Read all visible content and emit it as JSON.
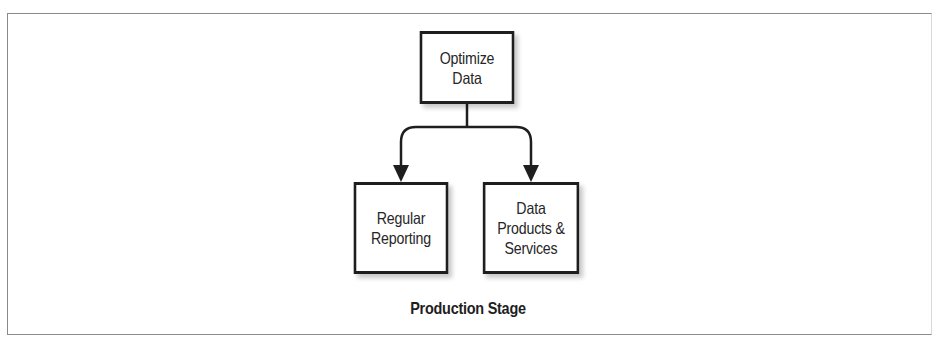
{
  "diagram": {
    "caption": "Production Stage",
    "nodes": {
      "optimize": {
        "label": "Optimize\nData"
      },
      "regular_reporting": {
        "label": "Regular\nReporting"
      },
      "data_products": {
        "label": "Data\nProducts &\nServices"
      }
    },
    "edges": [
      {
        "from": "Optimize Data",
        "to": "Regular Reporting"
      },
      {
        "from": "Optimize Data",
        "to": "Data Products & Services"
      }
    ],
    "colors": {
      "stroke": "#1e1e1e",
      "text": "#262626",
      "frame": "#8a8a8a",
      "background": "#ffffff"
    }
  }
}
